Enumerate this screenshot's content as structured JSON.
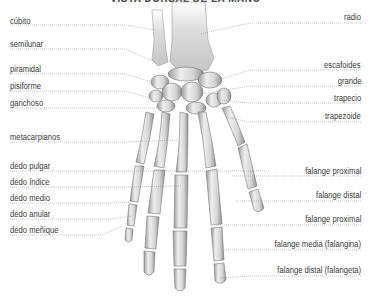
{
  "title": "VISTA DORSAL DE LA MANO",
  "labels_left": [
    {
      "text": "cúbito",
      "x": 10,
      "y": 16,
      "line_y": 25,
      "to": [
        155,
        30
      ]
    },
    {
      "text": "semilunar",
      "x": 10,
      "y": 39,
      "line_y": 49,
      "to": [
        155,
        62
      ]
    },
    {
      "text": "piramidal",
      "x": 10,
      "y": 64,
      "line_y": 74,
      "to": [
        152,
        82
      ]
    },
    {
      "text": "pisiforme",
      "x": 10,
      "y": 81,
      "line_y": 91,
      "to": [
        150,
        98
      ]
    },
    {
      "text": "ganchoso",
      "x": 10,
      "y": 98,
      "line_y": 108,
      "to": [
        160,
        108
      ]
    },
    {
      "text": "metacarpianos",
      "x": 10,
      "y": 132,
      "line_y": 142,
      "to": [
        178,
        140
      ]
    },
    {
      "text": "dedo pulgar",
      "x": 10,
      "y": 161,
      "line_y": 171,
      "to": [
        270,
        171
      ]
    },
    {
      "text": "dedo índice",
      "x": 10,
      "y": 177,
      "line_y": 187,
      "to": [
        182,
        186
      ]
    },
    {
      "text": "dedo medio",
      "x": 10,
      "y": 193,
      "line_y": 203,
      "to": [
        132,
        202
      ]
    },
    {
      "text": "dedo anular",
      "x": 10,
      "y": 209,
      "line_y": 219,
      "to": [
        132,
        216
      ]
    },
    {
      "text": "dedo meñique",
      "x": 10,
      "y": 225,
      "line_y": 235,
      "to": [
        122,
        226
      ]
    }
  ],
  "labels_right": [
    {
      "text": "radio",
      "rx": 10,
      "y": 12,
      "line_y": 23,
      "to": [
        200,
        34
      ]
    },
    {
      "text": "escafoides",
      "rx": 10,
      "y": 60,
      "line_y": 70,
      "to": [
        212,
        82
      ]
    },
    {
      "text": "grande",
      "rx": 10,
      "y": 76,
      "line_y": 86,
      "to": [
        200,
        94
      ]
    },
    {
      "text": "trapecio",
      "rx": 10,
      "y": 93,
      "line_y": 103,
      "to": [
        218,
        100
      ]
    },
    {
      "text": "trapezoide",
      "rx": 10,
      "y": 111,
      "line_y": 122,
      "to": [
        230,
        118
      ]
    },
    {
      "text": "falange proximal",
      "rx": 10,
      "y": 166,
      "line_y": 176,
      "to": [
        232,
        176
      ]
    },
    {
      "text": "falange distal",
      "rx": 10,
      "y": 190,
      "line_y": 201,
      "to": [
        236,
        201
      ]
    },
    {
      "text": "falange proximal",
      "rx": 10,
      "y": 214,
      "line_y": 225,
      "to": [
        216,
        225
      ]
    },
    {
      "text": "falange media (falangina)",
      "rx": 10,
      "y": 239,
      "line_y": 250,
      "to": [
        222,
        250
      ]
    },
    {
      "text": "falange distal (falangeta)",
      "rx": 10,
      "y": 265,
      "line_y": 276,
      "to": [
        220,
        278
      ]
    }
  ],
  "colors": {
    "bone_light": "#f2f2f2",
    "bone_mid": "#c9c9c9",
    "bone_dark": "#8a8a8a",
    "leader": "#9a9a9a",
    "text": "#3a3a3a"
  }
}
